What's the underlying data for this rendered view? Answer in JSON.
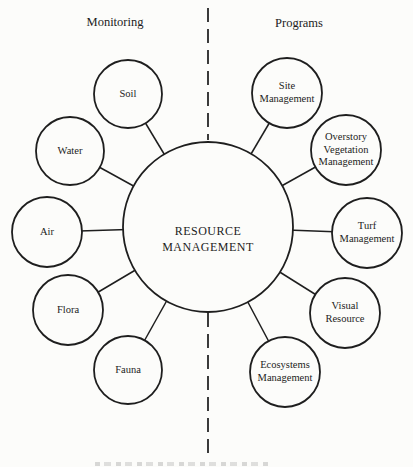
{
  "diagram": {
    "title_center": "RESOURCE\nMANAGEMENT",
    "left_column_header": "Monitoring",
    "right_column_header": "Programs",
    "monitoring_circles": [
      {
        "label": "Soil"
      },
      {
        "label": "Water"
      },
      {
        "label": "Air"
      },
      {
        "label": "Flora"
      },
      {
        "label": "Fauna"
      }
    ],
    "program_circles": [
      {
        "label": "Site\nManagement"
      },
      {
        "label": "Overstory\nVegetation\nManagement"
      },
      {
        "label": "Turf\nManagement"
      },
      {
        "label": "Visual\nResource"
      },
      {
        "label": "Ecosystems\nManagement"
      }
    ],
    "colors": {
      "stroke": "#1e1e1e",
      "background": "#fcfcfa",
      "text": "#1c1c1c"
    }
  }
}
